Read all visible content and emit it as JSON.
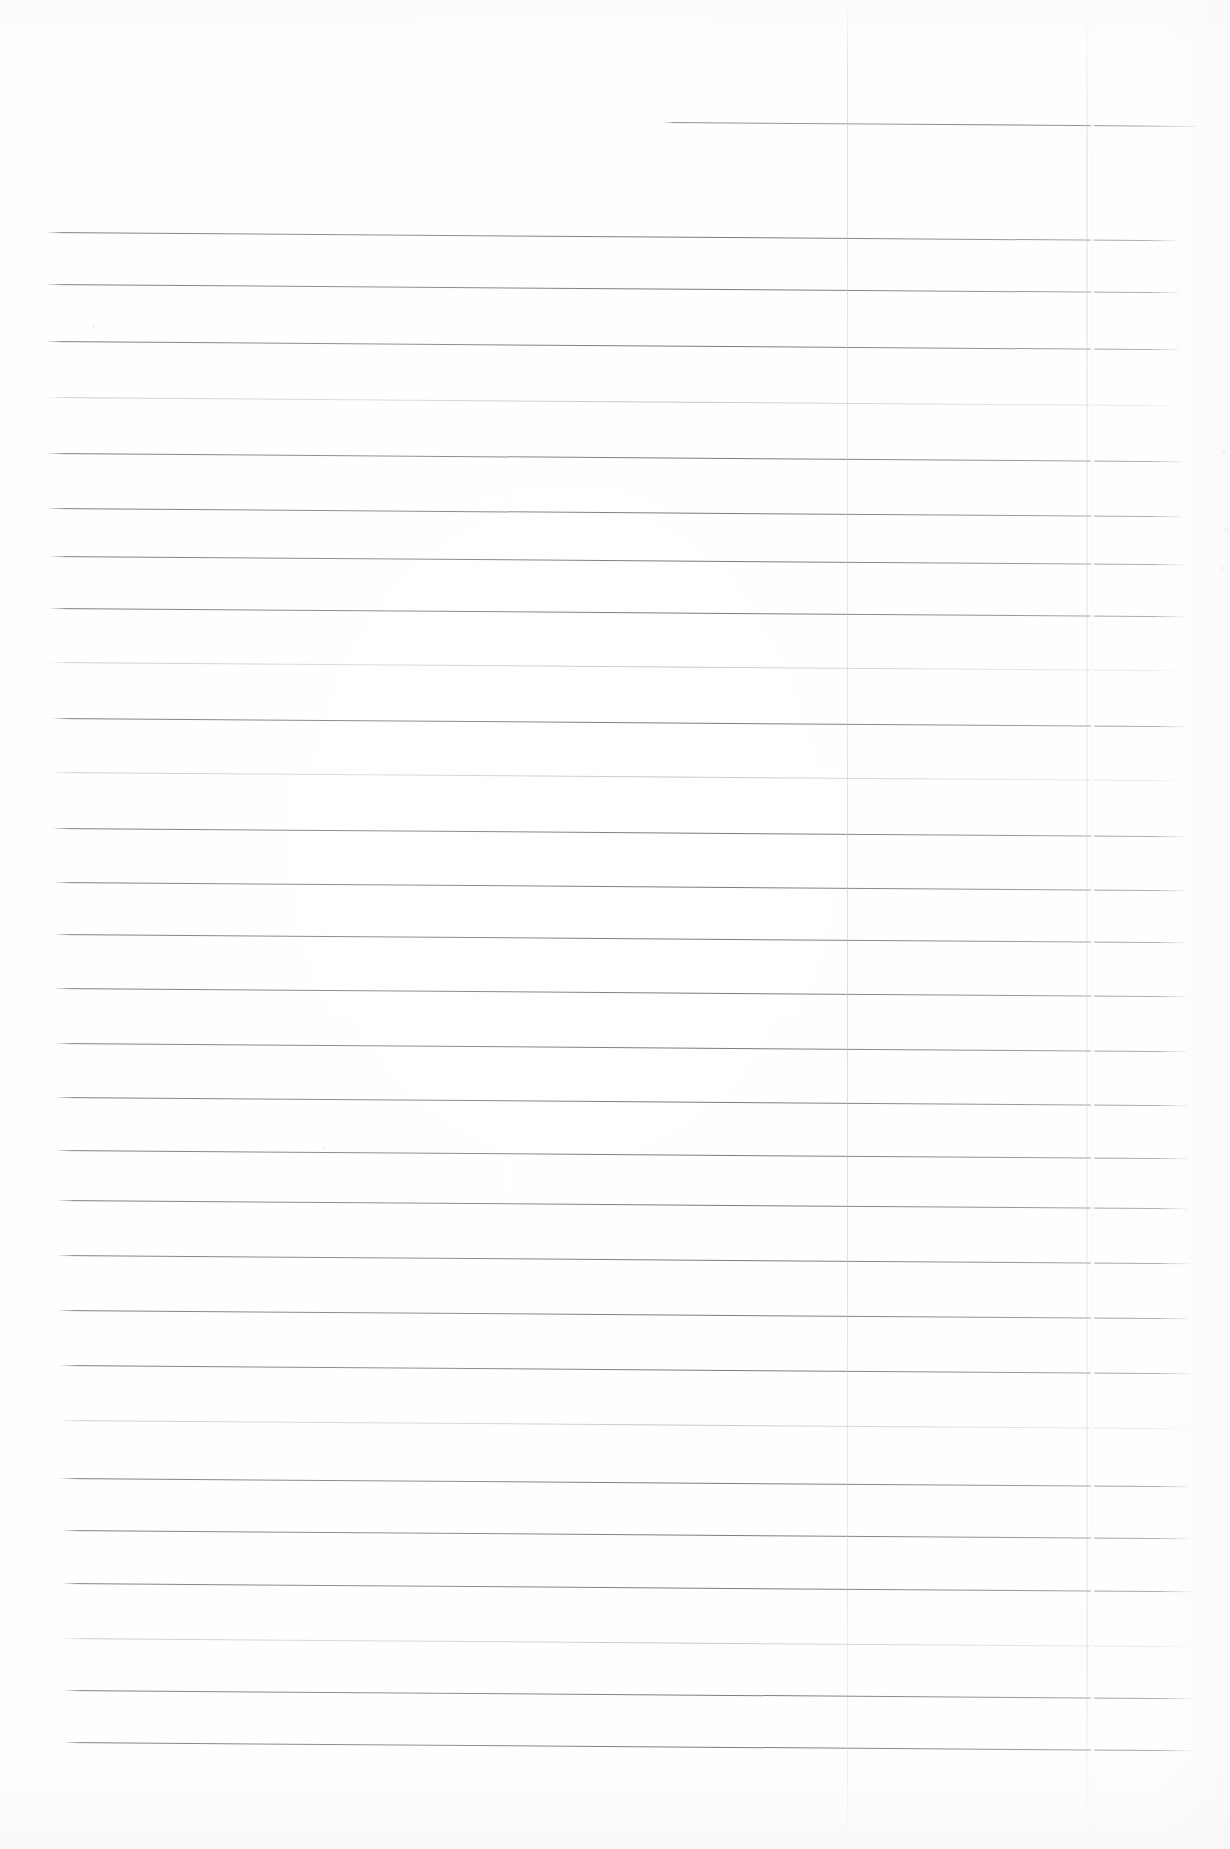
{
  "document": {
    "kind": "scanned-ruled-page",
    "description": "Blank scanned ruled notebook page",
    "page_width": 1230,
    "page_height": 1849,
    "background_color": "#ffffff",
    "rule_color_dark": "#76787f",
    "rule_color_light": "#aeb0b8",
    "vertical_line_color": "#c4c6cd",
    "crease_color": "#ffffff",
    "text_content": "",
    "visible_text": []
  },
  "ruling": {
    "left_x": 55,
    "right_x": 1175,
    "spacing": 62.7,
    "skew_degrees": 0.42,
    "count": 25,
    "lines": [
      {
        "y": 122,
        "x_start": 664,
        "x_end": 1196,
        "weight": "partial"
      },
      {
        "y": 232,
        "x_start": 46,
        "x_end": 1178,
        "weight": "dark"
      },
      {
        "y": 284,
        "x_start": 46,
        "x_end": 1180,
        "weight": "dark"
      },
      {
        "y": 341,
        "x_start": 46,
        "x_end": 1180,
        "weight": "dark"
      },
      {
        "y": 397,
        "x_start": 46,
        "x_end": 1182,
        "weight": "light"
      },
      {
        "y": 453,
        "x_start": 48,
        "x_end": 1182,
        "weight": "dark"
      },
      {
        "y": 508,
        "x_start": 48,
        "x_end": 1182,
        "weight": "dark"
      },
      {
        "y": 556,
        "x_start": 50,
        "x_end": 1184,
        "weight": "dark"
      },
      {
        "y": 608,
        "x_start": 50,
        "x_end": 1184,
        "weight": "dark"
      },
      {
        "y": 662,
        "x_start": 50,
        "x_end": 1184,
        "weight": "light"
      },
      {
        "y": 718,
        "x_start": 52,
        "x_end": 1186,
        "weight": "dark"
      },
      {
        "y": 772,
        "x_start": 52,
        "x_end": 1186,
        "weight": "light"
      },
      {
        "y": 828,
        "x_start": 52,
        "x_end": 1186,
        "weight": "dark"
      },
      {
        "y": 882,
        "x_start": 54,
        "x_end": 1186,
        "weight": "dark"
      },
      {
        "y": 934,
        "x_start": 54,
        "x_end": 1186,
        "weight": "dark"
      },
      {
        "y": 988,
        "x_start": 54,
        "x_end": 1188,
        "weight": "dark"
      },
      {
        "y": 1043,
        "x_start": 56,
        "x_end": 1188,
        "weight": "dark"
      },
      {
        "y": 1097,
        "x_start": 56,
        "x_end": 1188,
        "weight": "dark"
      },
      {
        "y": 1150,
        "x_start": 56,
        "x_end": 1188,
        "weight": "dark"
      },
      {
        "y": 1200,
        "x_start": 58,
        "x_end": 1188,
        "weight": "dark"
      },
      {
        "y": 1255,
        "x_start": 58,
        "x_end": 1190,
        "weight": "dark"
      },
      {
        "y": 1310,
        "x_start": 58,
        "x_end": 1190,
        "weight": "dark"
      },
      {
        "y": 1365,
        "x_start": 60,
        "x_end": 1190,
        "weight": "dark"
      },
      {
        "y": 1420,
        "x_start": 60,
        "x_end": 1190,
        "weight": "light"
      },
      {
        "y": 1478,
        "x_start": 60,
        "x_end": 1190,
        "weight": "dark"
      },
      {
        "y": 1530,
        "x_start": 62,
        "x_end": 1190,
        "weight": "dark"
      },
      {
        "y": 1583,
        "x_start": 62,
        "x_end": 1192,
        "weight": "dark"
      },
      {
        "y": 1638,
        "x_start": 62,
        "x_end": 1192,
        "weight": "light"
      },
      {
        "y": 1690,
        "x_start": 64,
        "x_end": 1192,
        "weight": "dark"
      },
      {
        "y": 1742,
        "x_start": 64,
        "x_end": 1192,
        "weight": "dark"
      }
    ]
  },
  "vertical_lines": [
    {
      "name": "margin-line",
      "x": 847,
      "y_start": 0,
      "y_end": 1849,
      "style": "grey"
    },
    {
      "name": "fold-crease",
      "x": 1090,
      "y_start": 0,
      "y_end": 1849,
      "style": "crease"
    }
  ],
  "artifacts": [
    {
      "x": 1222,
      "y": 451,
      "size": 4,
      "opacity": 0.18
    },
    {
      "x": 1224,
      "y": 528,
      "size": 5,
      "opacity": 0.16
    },
    {
      "x": 1221,
      "y": 566,
      "size": 4,
      "opacity": 0.14
    },
    {
      "x": 92,
      "y": 325,
      "size": 3,
      "opacity": 0.12
    },
    {
      "x": 322,
      "y": 1146,
      "size": 3,
      "opacity": 0.1
    },
    {
      "x": 855,
      "y": 1818,
      "size": 3,
      "opacity": 0.1
    }
  ]
}
